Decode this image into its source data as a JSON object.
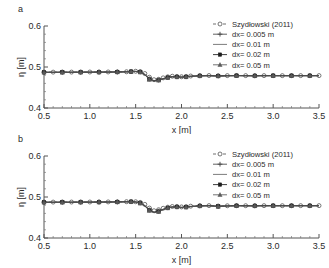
{
  "figure": {
    "panel_a_label": "a",
    "panel_b_label": "b"
  },
  "chart_data": [
    {
      "type": "line",
      "panel": "a",
      "title": "",
      "xlabel": "x [m]",
      "ylabel": "η [m]",
      "xlim": [
        0.5,
        3.5
      ],
      "ylim": [
        0.4,
        0.6
      ],
      "xticks": [
        0.5,
        1.0,
        1.5,
        2.0,
        2.5,
        3.0,
        3.5
      ],
      "xticklabels": [
        "0.5",
        "1.0",
        "1.5",
        "2.0",
        "2.5",
        "3.0",
        "3.5"
      ],
      "yticks": [
        0.4,
        0.5,
        0.6
      ],
      "yticklabels": [
        "0.4",
        "0.5",
        "0.6"
      ],
      "minor_xtick_count": 5,
      "minor_ytick_count": 5,
      "grid": false,
      "legend_position": "upper right",
      "series": [
        {
          "name": "Szydłowski (2011)",
          "marker": "open-circle",
          "linestyle": "dashed",
          "color": "#555555",
          "x": [
            0.5,
            0.6,
            0.7,
            0.8,
            0.9,
            1.0,
            1.1,
            1.2,
            1.3,
            1.4,
            1.45,
            1.5,
            1.55,
            1.6,
            1.65,
            1.7,
            1.75,
            1.8,
            1.85,
            1.9,
            1.95,
            2.0,
            2.05,
            2.1,
            2.2,
            2.3,
            2.4,
            2.5,
            2.6,
            2.7,
            2.8,
            2.9,
            3.0,
            3.1,
            3.2,
            3.3,
            3.4,
            3.5
          ],
          "y": [
            0.4875,
            0.4875,
            0.4876,
            0.4876,
            0.4877,
            0.4878,
            0.4878,
            0.4879,
            0.488,
            0.4884,
            0.489,
            0.4896,
            0.4888,
            0.484,
            0.475,
            0.469,
            0.47,
            0.4735,
            0.476,
            0.4775,
            0.477,
            0.4762,
            0.4768,
            0.478,
            0.479,
            0.4792,
            0.4786,
            0.479,
            0.4793,
            0.479,
            0.4788,
            0.479,
            0.479,
            0.4789,
            0.479,
            0.479,
            0.479,
            0.479
          ]
        },
        {
          "name": "dx= 0.005 m",
          "marker": "plus",
          "linestyle": "solid",
          "color": "#444444",
          "x": [
            0.5,
            0.6,
            0.7,
            0.8,
            0.9,
            1.0,
            1.1,
            1.2,
            1.3,
            1.4,
            1.45,
            1.5,
            1.55,
            1.6,
            1.65,
            1.7,
            1.75,
            1.8,
            1.85,
            1.9,
            1.95,
            2.0,
            2.05,
            2.1,
            2.2,
            2.3,
            2.4,
            2.5,
            2.6,
            2.7,
            2.8,
            2.9,
            3.0,
            3.1,
            3.2,
            3.3,
            3.4,
            3.5
          ],
          "y": [
            0.4872,
            0.4872,
            0.4873,
            0.4873,
            0.4874,
            0.4875,
            0.4876,
            0.4877,
            0.4879,
            0.4883,
            0.4889,
            0.4893,
            0.488,
            0.482,
            0.471,
            0.4665,
            0.4682,
            0.4715,
            0.4748,
            0.4765,
            0.4762,
            0.4755,
            0.4762,
            0.4775,
            0.4786,
            0.4789,
            0.4782,
            0.4787,
            0.479,
            0.4788,
            0.4786,
            0.4789,
            0.4789,
            0.4788,
            0.4789,
            0.4789,
            0.4789,
            0.4789
          ]
        },
        {
          "name": "dx= 0.01 m",
          "marker": "none",
          "linestyle": "solid",
          "color": "#666666",
          "x": [
            0.5,
            0.6,
            0.7,
            0.8,
            0.9,
            1.0,
            1.1,
            1.2,
            1.3,
            1.4,
            1.45,
            1.5,
            1.55,
            1.6,
            1.65,
            1.7,
            1.75,
            1.8,
            1.85,
            1.9,
            1.95,
            2.0,
            2.05,
            2.1,
            2.2,
            2.3,
            2.4,
            2.5,
            2.6,
            2.7,
            2.8,
            2.9,
            3.0,
            3.1,
            3.2,
            3.3,
            3.4,
            3.5
          ],
          "y": [
            0.4873,
            0.4873,
            0.4874,
            0.4874,
            0.4875,
            0.4876,
            0.4877,
            0.4878,
            0.488,
            0.4884,
            0.489,
            0.4894,
            0.4882,
            0.4826,
            0.4718,
            0.467,
            0.4686,
            0.472,
            0.475,
            0.4768,
            0.4764,
            0.4757,
            0.4764,
            0.4777,
            0.4787,
            0.479,
            0.4783,
            0.4788,
            0.4791,
            0.4789,
            0.4787,
            0.479,
            0.479,
            0.4789,
            0.479,
            0.479,
            0.479,
            0.479
          ]
        },
        {
          "name": "dx= 0.02 m",
          "marker": "filled-square",
          "linestyle": "solid",
          "color": "#1c1c1c",
          "x": [
            0.5,
            0.6,
            0.7,
            0.8,
            0.9,
            1.0,
            1.1,
            1.2,
            1.3,
            1.4,
            1.45,
            1.5,
            1.55,
            1.6,
            1.65,
            1.7,
            1.75,
            1.8,
            1.85,
            1.9,
            1.95,
            2.0,
            2.05,
            2.1,
            2.2,
            2.3,
            2.4,
            2.5,
            2.6,
            2.7,
            2.8,
            2.9,
            3.0,
            3.1,
            3.2,
            3.3,
            3.4,
            3.5
          ],
          "y": [
            0.487,
            0.487,
            0.4871,
            0.4871,
            0.4872,
            0.4873,
            0.4874,
            0.4876,
            0.4878,
            0.4882,
            0.4888,
            0.4892,
            0.4876,
            0.4812,
            0.47,
            0.466,
            0.4678,
            0.471,
            0.4742,
            0.476,
            0.4758,
            0.4752,
            0.476,
            0.4772,
            0.4784,
            0.4788,
            0.478,
            0.4786,
            0.4789,
            0.4787,
            0.4785,
            0.4788,
            0.4788,
            0.4787,
            0.4788,
            0.4788,
            0.4788,
            0.4788
          ]
        },
        {
          "name": "dx= 0.05 m",
          "marker": "triangle",
          "linestyle": "solid",
          "color": "#5a5a5a",
          "x": [
            0.5,
            0.6,
            0.7,
            0.8,
            0.9,
            1.0,
            1.1,
            1.2,
            1.3,
            1.4,
            1.45,
            1.5,
            1.55,
            1.6,
            1.65,
            1.7,
            1.75,
            1.8,
            1.85,
            1.9,
            1.95,
            2.0,
            2.05,
            2.1,
            2.2,
            2.3,
            2.4,
            2.5,
            2.6,
            2.7,
            2.8,
            2.9,
            3.0,
            3.1,
            3.2,
            3.3,
            3.4,
            3.5
          ],
          "y": [
            0.4868,
            0.4868,
            0.4869,
            0.487,
            0.4871,
            0.4872,
            0.4873,
            0.4875,
            0.4877,
            0.4881,
            0.4886,
            0.489,
            0.4872,
            0.4806,
            0.4694,
            0.4656,
            0.4674,
            0.4706,
            0.4738,
            0.4757,
            0.4755,
            0.475,
            0.4758,
            0.477,
            0.4782,
            0.4786,
            0.4778,
            0.4784,
            0.4788,
            0.4786,
            0.4784,
            0.4787,
            0.4787,
            0.4786,
            0.4787,
            0.4787,
            0.4787,
            0.4787
          ]
        }
      ]
    },
    {
      "type": "line",
      "panel": "b",
      "title": "",
      "xlabel": "x [m]",
      "ylabel": "η [m]",
      "xlim": [
        0.5,
        3.5
      ],
      "ylim": [
        0.4,
        0.6
      ],
      "xticks": [
        0.5,
        1.0,
        1.5,
        2.0,
        2.5,
        3.0,
        3.5
      ],
      "xticklabels": [
        "0.5",
        "1.0",
        "1.5",
        "2.0",
        "2.5",
        "3.0",
        "3.5"
      ],
      "yticks": [
        0.4,
        0.5,
        0.6
      ],
      "yticklabels": [
        "0.4",
        "0.5",
        "0.6"
      ],
      "minor_xtick_count": 5,
      "minor_ytick_count": 5,
      "grid": false,
      "legend_position": "upper right",
      "series": [
        {
          "name": "Szydłowski (2011)",
          "marker": "open-circle",
          "linestyle": "dashed",
          "color": "#555555",
          "x": [
            0.5,
            0.6,
            0.7,
            0.8,
            0.9,
            1.0,
            1.1,
            1.2,
            1.3,
            1.4,
            1.45,
            1.5,
            1.55,
            1.6,
            1.65,
            1.7,
            1.75,
            1.8,
            1.85,
            1.9,
            1.95,
            2.0,
            2.05,
            2.1,
            2.2,
            2.3,
            2.4,
            2.5,
            2.6,
            2.7,
            2.8,
            2.9,
            3.0,
            3.1,
            3.2,
            3.3,
            3.4,
            3.5
          ],
          "y": [
            0.4876,
            0.4876,
            0.4877,
            0.4877,
            0.4878,
            0.4878,
            0.4879,
            0.488,
            0.4882,
            0.4886,
            0.4888,
            0.4884,
            0.4868,
            0.482,
            0.473,
            0.4665,
            0.469,
            0.4725,
            0.4752,
            0.4768,
            0.477,
            0.4758,
            0.4764,
            0.4776,
            0.4788,
            0.479,
            0.4778,
            0.4786,
            0.479,
            0.4788,
            0.4787,
            0.4789,
            0.4789,
            0.4788,
            0.4789,
            0.4789,
            0.4789,
            0.4789
          ]
        },
        {
          "name": "dx= 0.005 m",
          "marker": "plus",
          "linestyle": "solid",
          "color": "#444444",
          "x": [
            0.5,
            0.6,
            0.7,
            0.8,
            0.9,
            1.0,
            1.1,
            1.2,
            1.3,
            1.4,
            1.45,
            1.5,
            1.55,
            1.6,
            1.65,
            1.7,
            1.75,
            1.8,
            1.85,
            1.9,
            1.95,
            2.0,
            2.05,
            2.1,
            2.2,
            2.3,
            2.4,
            2.5,
            2.6,
            2.7,
            2.8,
            2.9,
            3.0,
            3.1,
            3.2,
            3.3,
            3.4,
            3.5
          ],
          "y": [
            0.4873,
            0.4873,
            0.4874,
            0.4874,
            0.4875,
            0.4876,
            0.4877,
            0.4878,
            0.488,
            0.4884,
            0.4886,
            0.488,
            0.4856,
            0.479,
            0.4684,
            0.463,
            0.4655,
            0.47,
            0.4738,
            0.4758,
            0.476,
            0.4748,
            0.4756,
            0.477,
            0.4784,
            0.4788,
            0.4774,
            0.4783,
            0.4788,
            0.4786,
            0.4785,
            0.4788,
            0.4788,
            0.4787,
            0.4788,
            0.4788,
            0.4788,
            0.4788
          ]
        },
        {
          "name": "dx= 0.01 m",
          "marker": "none",
          "linestyle": "solid",
          "color": "#666666",
          "x": [
            0.5,
            0.6,
            0.7,
            0.8,
            0.9,
            1.0,
            1.1,
            1.2,
            1.3,
            1.4,
            1.45,
            1.5,
            1.55,
            1.6,
            1.65,
            1.7,
            1.75,
            1.8,
            1.85,
            1.9,
            1.95,
            2.0,
            2.05,
            2.1,
            2.2,
            2.3,
            2.4,
            2.5,
            2.6,
            2.7,
            2.8,
            2.9,
            3.0,
            3.1,
            3.2,
            3.3,
            3.4,
            3.5
          ],
          "y": [
            0.4874,
            0.4874,
            0.4875,
            0.4875,
            0.4876,
            0.4877,
            0.4878,
            0.4879,
            0.4881,
            0.4885,
            0.4887,
            0.4881,
            0.4858,
            0.4795,
            0.469,
            0.4636,
            0.466,
            0.4705,
            0.4742,
            0.4761,
            0.4763,
            0.4751,
            0.4758,
            0.4772,
            0.4785,
            0.4789,
            0.4776,
            0.4784,
            0.4789,
            0.4787,
            0.4786,
            0.4789,
            0.4789,
            0.4788,
            0.4789,
            0.4789,
            0.4789,
            0.4789
          ]
        },
        {
          "name": "dx= 0.02 m",
          "marker": "filled-square",
          "linestyle": "solid",
          "color": "#1c1c1c",
          "x": [
            0.5,
            0.6,
            0.7,
            0.8,
            0.9,
            1.0,
            1.1,
            1.2,
            1.3,
            1.4,
            1.45,
            1.5,
            1.55,
            1.6,
            1.65,
            1.7,
            1.75,
            1.8,
            1.85,
            1.9,
            1.95,
            2.0,
            2.05,
            2.1,
            2.2,
            2.3,
            2.4,
            2.5,
            2.6,
            2.7,
            2.8,
            2.9,
            3.0,
            3.1,
            3.2,
            3.3,
            3.4,
            3.5
          ],
          "y": [
            0.4871,
            0.4871,
            0.4872,
            0.4872,
            0.4873,
            0.4874,
            0.4875,
            0.4877,
            0.4879,
            0.4883,
            0.4885,
            0.4877,
            0.485,
            0.4782,
            0.4675,
            0.4622,
            0.4648,
            0.4694,
            0.4733,
            0.4754,
            0.4757,
            0.4744,
            0.4752,
            0.4767,
            0.4782,
            0.4787,
            0.4771,
            0.4781,
            0.4787,
            0.4785,
            0.4784,
            0.4787,
            0.4787,
            0.4786,
            0.4787,
            0.4787,
            0.4787,
            0.4787
          ]
        },
        {
          "name": "dx= 0.05 m",
          "marker": "triangle",
          "linestyle": "solid",
          "color": "#5a5a5a",
          "x": [
            0.5,
            0.6,
            0.7,
            0.8,
            0.9,
            1.0,
            1.1,
            1.2,
            1.3,
            1.4,
            1.45,
            1.5,
            1.55,
            1.6,
            1.65,
            1.7,
            1.75,
            1.8,
            1.85,
            1.9,
            1.95,
            2.0,
            2.05,
            2.1,
            2.2,
            2.3,
            2.4,
            2.5,
            2.6,
            2.7,
            2.8,
            2.9,
            3.0,
            3.1,
            3.2,
            3.3,
            3.4,
            3.5
          ],
          "y": [
            0.4869,
            0.4869,
            0.487,
            0.4871,
            0.4872,
            0.4873,
            0.4874,
            0.4876,
            0.4878,
            0.4882,
            0.4884,
            0.4875,
            0.4846,
            0.4776,
            0.4668,
            0.4616,
            0.4642,
            0.469,
            0.473,
            0.4752,
            0.4755,
            0.4741,
            0.475,
            0.4765,
            0.478,
            0.4786,
            0.4769,
            0.478,
            0.4786,
            0.4784,
            0.4783,
            0.4786,
            0.4786,
            0.4785,
            0.4786,
            0.4786,
            0.4786,
            0.4786
          ]
        }
      ]
    }
  ]
}
